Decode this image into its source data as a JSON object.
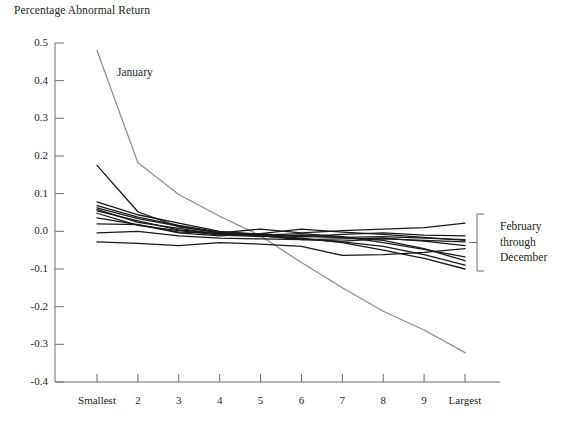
{
  "figure": {
    "title": "Percentage Abnormal Return",
    "width": 567,
    "height": 421,
    "background": "#ffffff"
  },
  "annotations": {
    "january_label": "January",
    "bracket_line_1": "February",
    "bracket_line_2": "through",
    "bracket_line_3": "December"
  },
  "colors": {
    "axis": "#6e6e6e",
    "january_line": "#8c8c8c",
    "other_lines": "#1a1a1a",
    "text": "#231f20"
  },
  "chart_data": {
    "type": "line",
    "title": "Percentage Abnormal Return",
    "xlabel": "",
    "ylabel": "Percentage Abnormal Return",
    "categories": [
      "Smallest",
      "2",
      "3",
      "4",
      "5",
      "6",
      "7",
      "8",
      "9",
      "Largest"
    ],
    "ylim": [
      -0.4,
      0.5
    ],
    "yticks": [
      0.5,
      0.4,
      0.3,
      0.2,
      0.1,
      0.0,
      -0.1,
      -0.2,
      -0.3,
      -0.4
    ],
    "ytick_labels": [
      "0.5",
      "0.4",
      "0.3",
      "0.2",
      "0.1",
      "0.0",
      "-0.1",
      "-0.2",
      "-0.3",
      "-0.4"
    ],
    "grid": false,
    "legend": "bracket-right",
    "legend_entries": [
      "January",
      "February through December"
    ],
    "series": [
      {
        "name": "January",
        "color": "#8c8c8c",
        "values": [
          0.48,
          0.182,
          0.098,
          0.04,
          -0.012,
          -0.083,
          -0.15,
          -0.212,
          -0.262,
          -0.322
        ]
      },
      {
        "name": "Month 2",
        "color": "#1a1a1a",
        "values": [
          0.175,
          0.052,
          0.012,
          -0.004,
          -0.012,
          -0.02,
          -0.028,
          -0.04,
          -0.062,
          -0.09
        ]
      },
      {
        "name": "Month 3",
        "color": "#1a1a1a",
        "values": [
          0.078,
          0.044,
          0.022,
          0.0,
          -0.008,
          -0.014,
          -0.016,
          -0.024,
          -0.046,
          -0.078
        ]
      },
      {
        "name": "Month 4",
        "color": "#1a1a1a",
        "values": [
          0.068,
          0.038,
          0.016,
          -0.002,
          -0.01,
          -0.006,
          -0.014,
          -0.03,
          -0.048,
          -0.068
        ]
      },
      {
        "name": "Month 5",
        "color": "#1a1a1a",
        "values": [
          0.062,
          0.034,
          0.014,
          -0.004,
          -0.012,
          -0.022,
          -0.02,
          -0.018,
          -0.026,
          -0.038
        ]
      },
      {
        "name": "Month 6",
        "color": "#1a1a1a",
        "values": [
          0.054,
          0.028,
          0.004,
          -0.006,
          -0.006,
          0.006,
          -0.002,
          -0.008,
          -0.016,
          -0.024
        ]
      },
      {
        "name": "Month 7",
        "color": "#1a1a1a",
        "values": [
          0.048,
          0.016,
          0.002,
          -0.01,
          -0.014,
          -0.01,
          -0.016,
          -0.014,
          -0.018,
          -0.022
        ]
      },
      {
        "name": "Month 8",
        "color": "#1a1a1a",
        "values": [
          0.036,
          0.018,
          -0.002,
          -0.004,
          0.006,
          -0.004,
          0.002,
          0.006,
          0.01,
          0.022
        ],
        "note": "highest at Largest"
      },
      {
        "name": "Month 9",
        "color": "#1a1a1a",
        "values": [
          0.02,
          0.018,
          -0.004,
          -0.012,
          -0.006,
          -0.014,
          -0.008,
          -0.004,
          -0.01,
          -0.012
        ]
      },
      {
        "name": "Month 10",
        "color": "#1a1a1a",
        "values": [
          -0.004,
          0.0,
          -0.012,
          -0.018,
          -0.02,
          -0.022,
          -0.026,
          -0.02,
          -0.024,
          -0.028
        ]
      },
      {
        "name": "Month 11",
        "color": "#1a1a1a",
        "values": [
          -0.028,
          -0.032,
          -0.038,
          -0.03,
          -0.034,
          -0.04,
          -0.064,
          -0.062,
          -0.056,
          -0.046
        ]
      },
      {
        "name": "Month 12",
        "color": "#1a1a1a",
        "values": [
          0.058,
          0.024,
          0.008,
          -0.008,
          -0.01,
          -0.018,
          -0.03,
          -0.05,
          -0.072,
          -0.1
        ]
      }
    ]
  }
}
